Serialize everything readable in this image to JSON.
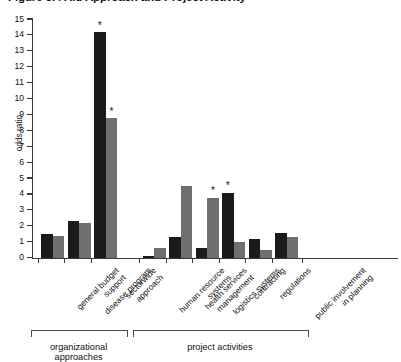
{
  "chart_data": {
    "type": "bar",
    "title": "Figure 5.4  Aid Approach and Project Activity",
    "xlabel": "",
    "ylabel": "odds ratio",
    "ylim": [
      0,
      15
    ],
    "ytick_step": 1,
    "yticks": [
      "0",
      "1",
      "2",
      "3",
      "4",
      "5",
      "6",
      "7",
      "8",
      "9",
      "10",
      "11",
      "12",
      "13",
      "14",
      "15"
    ],
    "grid": false,
    "legend": "none",
    "significance_marker": "*",
    "categories": [
      "general budget support",
      "disease program",
      "sectorwide approach",
      "human resource systems",
      "health services management",
      "logistics systems",
      "contracting",
      "regulations",
      "public involvement in planning"
    ],
    "category_lines": [
      [
        "general budget",
        "support"
      ],
      [
        "disease program"
      ],
      [
        "sectorwide",
        "approach"
      ],
      [
        "human resource",
        "systems"
      ],
      [
        "health services",
        "management"
      ],
      [
        "logistics systems"
      ],
      [
        "contracting"
      ],
      [
        "regulations"
      ],
      [
        "public involvement",
        "in planning"
      ]
    ],
    "series": [
      {
        "name": "series-dark",
        "color": "#1b1b1b",
        "values": [
          1.5,
          2.3,
          14.2,
          0.15,
          1.3,
          0.6,
          4.1,
          1.2,
          1.6
        ],
        "significant": [
          false,
          false,
          true,
          false,
          false,
          false,
          true,
          false,
          false
        ]
      },
      {
        "name": "series-gray",
        "color": "#6f6f6f",
        "values": [
          1.4,
          2.2,
          8.8,
          0.6,
          4.5,
          3.8,
          1.0,
          0.5,
          1.3
        ],
        "significant": [
          false,
          false,
          true,
          false,
          false,
          true,
          false,
          false,
          false
        ]
      }
    ],
    "groups": [
      {
        "label": "organizational approaches",
        "categories": [
          0,
          1,
          2
        ]
      },
      {
        "label": "project activities",
        "categories": [
          3,
          4,
          5,
          6,
          7,
          8
        ]
      }
    ]
  }
}
